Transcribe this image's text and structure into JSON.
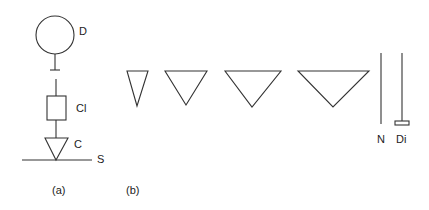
{
  "figure": {
    "panel_a": {
      "caption": "(a)",
      "labels": {
        "drop": "D",
        "clear": "Cl",
        "contact": "C",
        "surface": "S"
      }
    },
    "panel_b": {
      "caption": "(b)",
      "triangle_count": 4,
      "labels": {
        "needle": "N",
        "disk": "Di"
      }
    },
    "stroke_color": "#333333",
    "background": "#ffffff"
  }
}
